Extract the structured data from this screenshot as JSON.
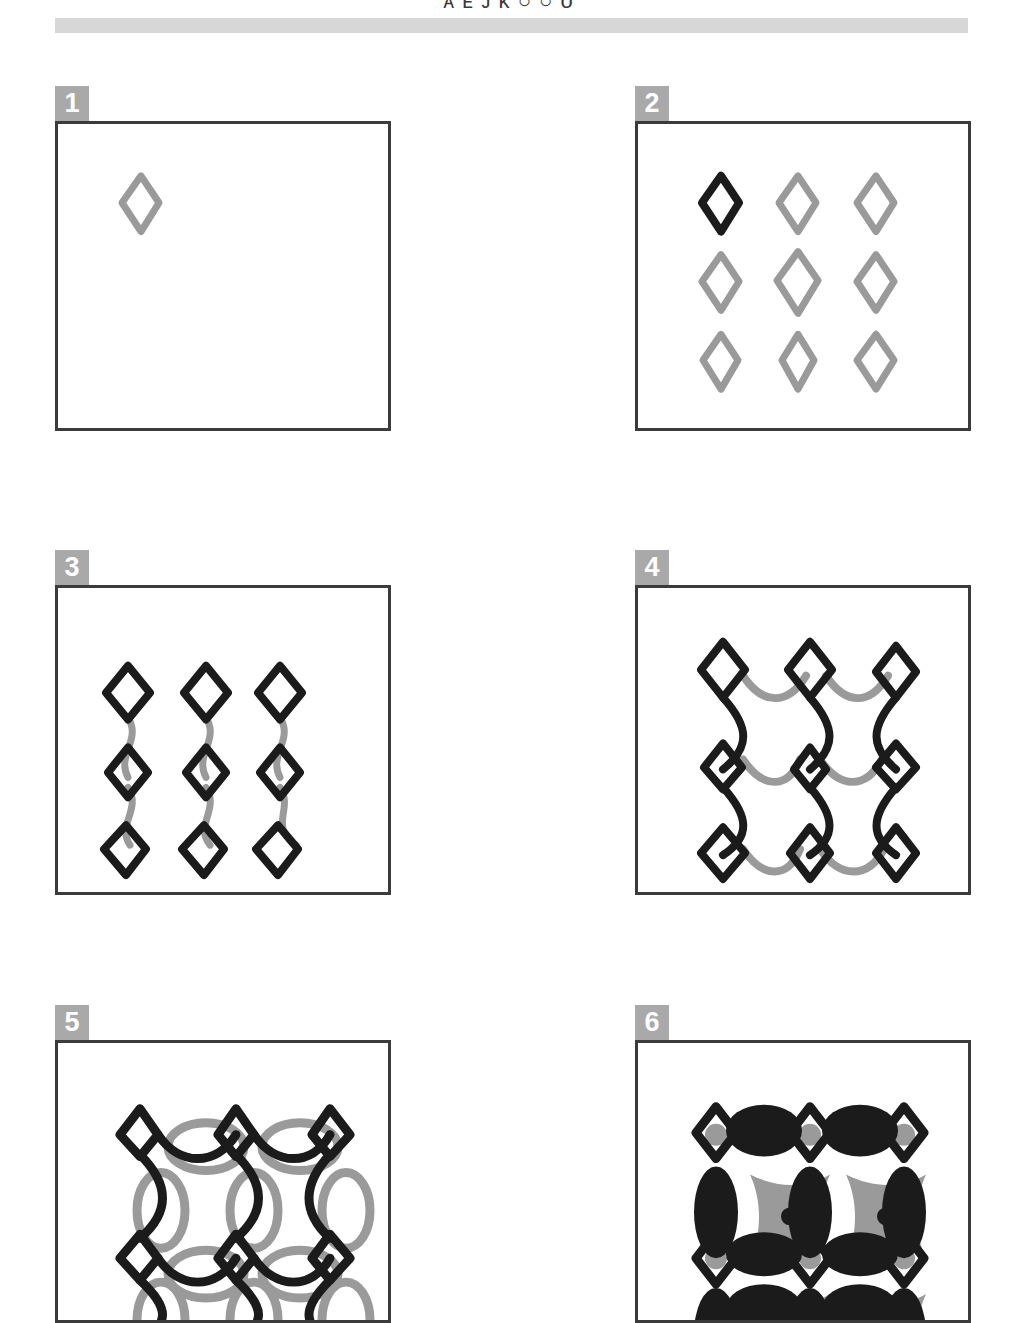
{
  "header": {
    "title": "ᴀ ᴇ ᴊ ᴋ ○ ○ ᴏ",
    "rule_color": "#d7d7d7"
  },
  "colors": {
    "ink_black": "#1b1b1b",
    "ink_gray": "#9a9a9a",
    "frame": "#3b3b3b",
    "badge_bg": "#a9a9a9",
    "badge_text": "#ffffff",
    "paper": "#ffffff"
  },
  "panels": [
    {
      "number": "1",
      "name": "single-motif",
      "description": "One gray diamond outline placed in the upper-left quadrant of an empty frame.",
      "motif_count": 1,
      "motifs": [
        {
          "shape": "diamond",
          "color": "#9a9a9a",
          "cx": 0.25,
          "cy": 0.26,
          "rx": 0.055,
          "ry": 0.095,
          "stroke": 6
        }
      ]
    },
    {
      "number": "2",
      "name": "three-by-three-grid",
      "description": "Three-by-three grid of diamond outlines; the top-left diamond is inked black, the remaining eight are gray.",
      "motif_count": 9,
      "rows": 3,
      "cols": 3,
      "highlight_index": 0,
      "highlight_color": "#1b1b1b",
      "base_color": "#9a9a9a"
    },
    {
      "number": "3",
      "name": "vertical-translation",
      "description": "Three columns of three black diamonds joined vertically by gray S-shaped connector curves.",
      "motif_count": 9,
      "rows": 3,
      "cols": 3,
      "connector_axis": "vertical",
      "connector_color": "#9a9a9a",
      "motif_color": "#1b1b1b"
    },
    {
      "number": "4",
      "name": "lattice-both-axes",
      "description": "Same nine diamonds now linked by black vertical curves and gray horizontal curves, producing an open lattice.",
      "motif_count": 9,
      "rows": 3,
      "cols": 3,
      "vertical_connector_color": "#1b1b1b",
      "horizontal_connector_color": "#9a9a9a",
      "motif_color": "#1b1b1b"
    },
    {
      "number": "5",
      "name": "interlaced-overlay",
      "description": "Dense black lattice of diamonds and arcs with a gray copy of the same lattice offset behind it; pattern runs past the bottom edge of the frame.",
      "motif_count": 12,
      "rows": 4,
      "cols": 3,
      "overlay_color": "#9a9a9a",
      "motif_color": "#1b1b1b",
      "overflow": "bottom"
    },
    {
      "number": "6",
      "name": "inked-solid-pattern",
      "description": "Fully inked version: heavy black blobs and bars with gray cushion shapes and small black dots filling the cells; pattern runs past the bottom edge of the frame.",
      "motif_count": 12,
      "rows": 4,
      "cols": 3,
      "fill_gray": "#9a9a9a",
      "fill_black": "#1b1b1b",
      "overflow": "bottom"
    }
  ]
}
